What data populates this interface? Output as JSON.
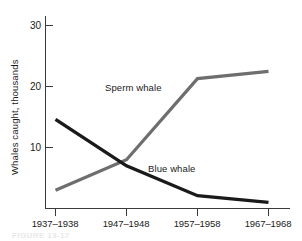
{
  "figure": {
    "caption_partial": "FIGURE 13-17"
  },
  "chart_data": {
    "type": "line",
    "title": "",
    "xlabel": "",
    "ylabel": "Whales caught, thousands",
    "categories": [
      "1937–1938",
      "1947–1948",
      "1957–1958",
      "1967–1968"
    ],
    "ylim": [
      0,
      32
    ],
    "yticks": [
      10,
      20,
      30
    ],
    "ytick_labels": [
      "10",
      "20",
      "30"
    ],
    "grid": false,
    "legend_position": "inline-annotations",
    "series": [
      {
        "name": "Sperm whale",
        "color": "#6e6e6e",
        "values": [
          3.0,
          8.0,
          21.3,
          22.5
        ],
        "annotation": {
          "text": "Sperm whale",
          "x_px": 105,
          "y_px": 91
        }
      },
      {
        "name": "Blue whale",
        "color": "#1a1a1a",
        "values": [
          14.6,
          7.0,
          2.1,
          1.0
        ],
        "annotation": {
          "text": "Blue whale",
          "x_px": 148,
          "y_px": 172
        }
      }
    ]
  },
  "axes": {
    "y_axis_title": "Whales caught, thousands",
    "y_tick_30": "30",
    "y_tick_20": "20",
    "y_tick_10": "10",
    "x_tick_0": "1937–1938",
    "x_tick_1": "1947–1948",
    "x_tick_2": "1957–1958",
    "x_tick_3": "1967–1968"
  },
  "annotations": {
    "sperm_whale": "Sperm whale",
    "blue_whale": "Blue whale"
  },
  "colors": {
    "sperm_whale_line": "#6e6e6e",
    "blue_whale_line": "#1a1a1a",
    "axis": "#3a3a3a",
    "background": "#ffffff"
  }
}
